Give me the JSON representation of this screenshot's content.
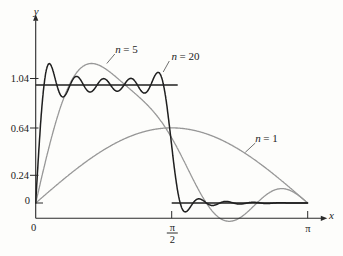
{
  "figure": {
    "background": "#fdfdfb",
    "ink": "#222222"
  },
  "chart_data": {
    "type": "line",
    "x_axis": {
      "label": "x",
      "range": [
        0,
        3.14159
      ],
      "ticks": [
        {
          "value": 0,
          "label": "0"
        },
        {
          "value": 1.570796,
          "label": "π/2",
          "numerator": "π",
          "denominator": "2"
        },
        {
          "value": 3.14159,
          "label": "π"
        }
      ]
    },
    "y_axis": {
      "label": "y",
      "range": [
        -0.25,
        1.3
      ],
      "ticks": [
        {
          "value": 0,
          "label": "0"
        },
        {
          "value": 0.24,
          "label": "0.24"
        },
        {
          "value": 0.64,
          "label": "0.64"
        },
        {
          "value": 1.04,
          "label": "1.04"
        }
      ]
    },
    "square_wave": {
      "color": "#1f1f1f",
      "segments": [
        {
          "x0": 0,
          "x1": 1.570796,
          "y": 1
        },
        {
          "x0": 1.570796,
          "x1": 3.14159,
          "y": 0
        }
      ]
    },
    "series": [
      {
        "name": "n = 1",
        "label_var": "n",
        "label_eq": "= 1",
        "terms": 1,
        "color": "#979797",
        "sine_coefficients": [
          0.63662
        ]
      },
      {
        "name": "n = 5",
        "label_var": "n",
        "label_eq": "= 5",
        "terms": 5,
        "color": "#979797",
        "sine_coefficients": [
          0.63662,
          0.63662,
          0.21221,
          0,
          0.12732
        ]
      },
      {
        "name": "n = 20",
        "label_var": "n",
        "label_eq": "= 20",
        "terms": 20,
        "color": "#1f1f1f",
        "sine_coefficients": [
          0.63662,
          0.63662,
          0.21221,
          0,
          0.12732,
          0.21221,
          0.09095,
          0,
          0.07074,
          0.12732,
          0.05787,
          0,
          0.04897,
          0.09095,
          0.04244,
          0,
          0.03745,
          0.07074,
          0.03351,
          0
        ]
      }
    ]
  }
}
